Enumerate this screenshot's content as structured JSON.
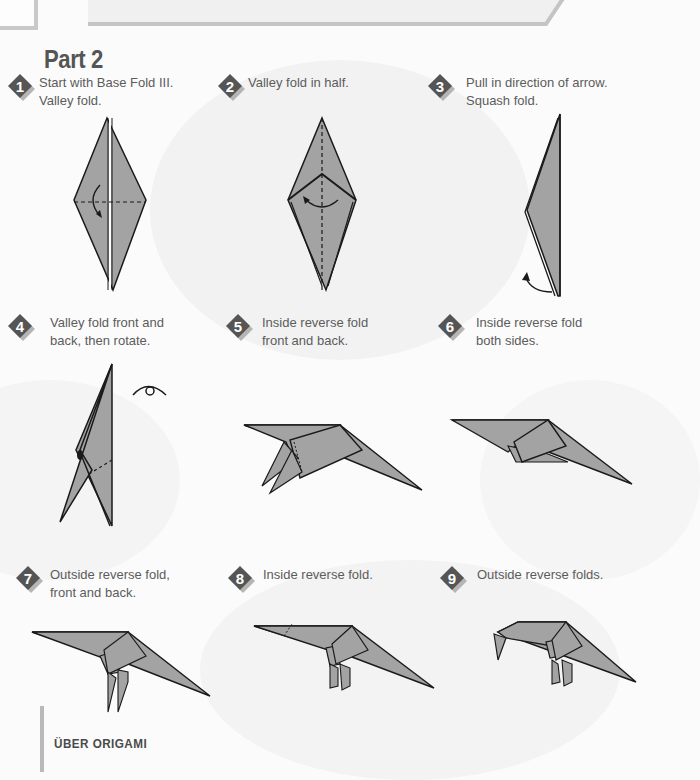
{
  "page": {
    "section_title": "Part 2",
    "footer_title": "ÜBER ORIGAMI",
    "colors": {
      "paper_fill": "#a3a3a3",
      "line": "#1a1a1a",
      "badge": "#555555",
      "badge_shadow": "#b5b5b5",
      "text": "#5c5c5c",
      "background": "#fbfbfb"
    }
  },
  "steps": [
    {
      "number": "1",
      "lines": [
        "Start with Base Fold III.",
        "Valley fold."
      ],
      "icon": "valley-fold-arrow"
    },
    {
      "number": "2",
      "lines": [
        "Valley fold in half."
      ],
      "icon": "valley-fold-arrow"
    },
    {
      "number": "3",
      "lines": [
        "Pull in direction of arrow.",
        "Squash fold."
      ],
      "icon": "pull-arrow"
    },
    {
      "number": "4",
      "lines": [
        "Valley fold front and",
        "back, then rotate."
      ],
      "icon": "rotate-eye"
    },
    {
      "number": "5",
      "lines": [
        "Inside reverse fold",
        "front and back."
      ],
      "icon": "none"
    },
    {
      "number": "6",
      "lines": [
        "Inside reverse fold",
        "both sides."
      ],
      "icon": "none"
    },
    {
      "number": "7",
      "lines": [
        "Outside reverse fold,",
        "front and back."
      ],
      "icon": "none"
    },
    {
      "number": "8",
      "lines": [
        "Inside reverse fold."
      ],
      "icon": "none"
    },
    {
      "number": "9",
      "lines": [
        "Outside reverse folds."
      ],
      "icon": "none"
    }
  ]
}
